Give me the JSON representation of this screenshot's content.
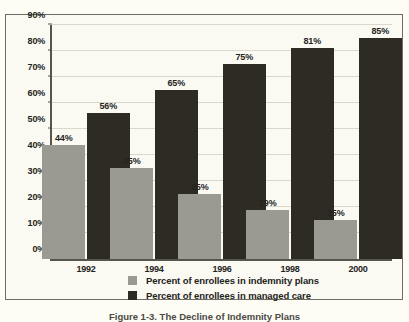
{
  "chart_data": {
    "type": "bar",
    "title": "",
    "xlabel": "",
    "ylabel": "",
    "categories": [
      "1992",
      "1994",
      "1996",
      "1998",
      "2000"
    ],
    "series": [
      {
        "name": "Percent of enrollees in indemnity plans",
        "color": "#9a9a92",
        "values": [
          44,
          35,
          25,
          19,
          15
        ],
        "labels": [
          "44%",
          "35%",
          "25%",
          "19%",
          "15%"
        ]
      },
      {
        "name": "Percent of enrollees in managed care",
        "color": "#2e2b24",
        "values": [
          56,
          65,
          75,
          81,
          85
        ],
        "labels": [
          "56%",
          "65%",
          "75%",
          "81%",
          "85%"
        ]
      }
    ],
    "ylim": [
      0,
      90
    ],
    "ytick_values": [
      0,
      10,
      20,
      30,
      40,
      50,
      60,
      70,
      80,
      90
    ],
    "ytick_labels": [
      "0%",
      "10%",
      "20%",
      "30%",
      "40%",
      "50%",
      "60%",
      "70%",
      "80%",
      "90%"
    ],
    "grid": true,
    "legend_position": "bottom-center"
  },
  "legend": {
    "items": [
      {
        "label": "Percent of enrollees in indemnity plans",
        "swatch": "indemnity"
      },
      {
        "label": "Percent of enrollees in managed care",
        "swatch": "managed"
      }
    ]
  },
  "caption": {
    "text": "Figure 1-3. The Decline of Indemnity Plans"
  }
}
